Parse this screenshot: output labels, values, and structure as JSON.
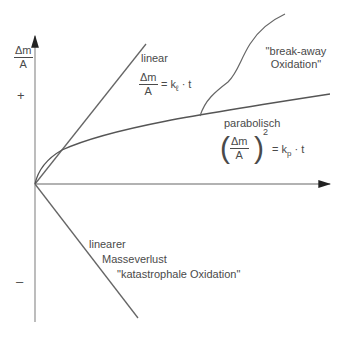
{
  "diagram": {
    "y_axis": {
      "label_num": "Δm",
      "label_den": "A",
      "plus": "+",
      "minus": "–"
    },
    "curves": {
      "linear": {
        "label": "linear",
        "eq_num": "Δm",
        "eq_den": "A",
        "eq_rhs": "= k",
        "eq_sub": "ℓ",
        "eq_tail": " · t"
      },
      "parabolic": {
        "label": "parabolisch",
        "eq_num": "Δm",
        "eq_den": "A",
        "eq_exp": "2",
        "eq_rhs": "= k",
        "eq_sub": "p",
        "eq_tail": " · t"
      },
      "breakaway": {
        "line1": "\"break-away",
        "line2": "Oxidation\""
      },
      "loss": {
        "line1": "linearer",
        "line2": "Masseverlust",
        "line3": "\"katastrophale Oxidation\""
      }
    },
    "colors": {
      "line": "#555555",
      "axis": "#888888",
      "text": "#4a4a4a"
    }
  }
}
